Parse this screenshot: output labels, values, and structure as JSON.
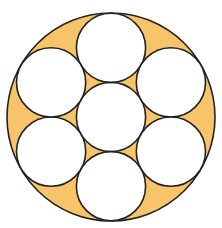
{
  "diagram": {
    "type": "circle-packing",
    "colors": {
      "background": "#ffffff",
      "shaded_region": "#F7C46A",
      "inner_circle_fill": "#ffffff",
      "stroke": "#222222"
    },
    "outer_circle": {
      "cx": 111,
      "cy": 117,
      "r": 104
    },
    "inner_circle_radius": 34.6,
    "inner_circles": [
      {
        "name": "center",
        "cx": 111,
        "cy": 117
      },
      {
        "name": "top",
        "cx": 111,
        "cy": 47.8
      },
      {
        "name": "upper-right",
        "cx": 170.9,
        "cy": 82.4
      },
      {
        "name": "lower-right",
        "cx": 170.9,
        "cy": 151.6
      },
      {
        "name": "bottom",
        "cx": 111,
        "cy": 186.2
      },
      {
        "name": "lower-left",
        "cx": 51.1,
        "cy": 151.6
      },
      {
        "name": "upper-left",
        "cx": 51.1,
        "cy": 82.4
      }
    ],
    "stroke_width": 1.6
  }
}
